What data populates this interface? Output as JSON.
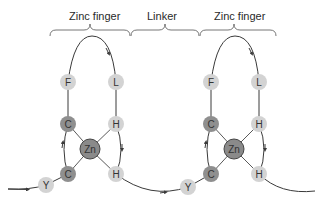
{
  "diagram": {
    "labels": {
      "finger1": "Zinc finger",
      "linker": "Linker",
      "finger2": "Zinc finger"
    },
    "colors": {
      "light_residue": "#d3d3d3",
      "dark_residue": "#8f8f8f",
      "zinc": "#8a8a8a",
      "line": "#3a3a3a"
    },
    "finger1": {
      "F": "F",
      "L": "L",
      "C_top": "C",
      "H_top": "H",
      "Zn": "Zn",
      "C_bottom": "C",
      "H_bottom": "H",
      "Y": "Y"
    },
    "finger2": {
      "F": "F",
      "L": "L",
      "C_top": "C",
      "H_top": "H",
      "Zn": "Zn",
      "C_bottom": "C",
      "H_bottom": "H",
      "Y": "Y"
    }
  }
}
